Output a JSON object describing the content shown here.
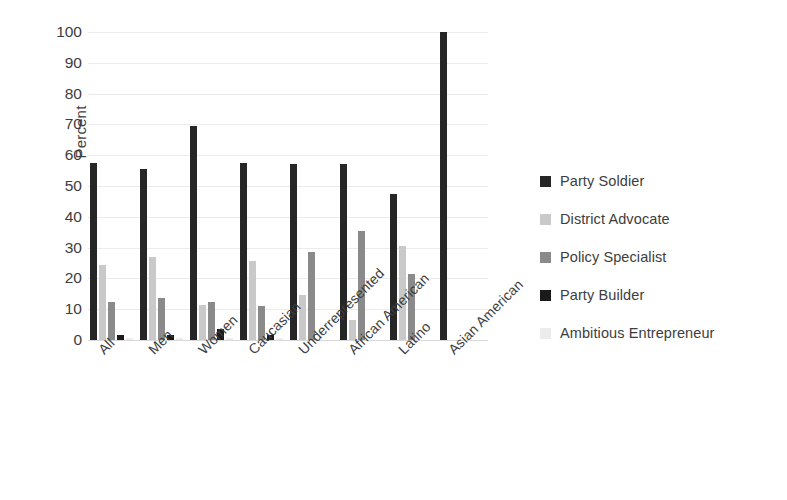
{
  "chart_data": {
    "type": "bar",
    "title": "",
    "subtitle": "",
    "xlabel": "",
    "ylabel": "Percent",
    "ylim": [
      0,
      100
    ],
    "yticks": [
      100,
      90,
      80,
      70,
      60,
      50,
      40,
      30,
      20,
      10,
      0
    ],
    "grid": true,
    "legend_position": "right",
    "categories": [
      "All",
      "Men",
      "Women",
      "Caucasian",
      "Underrepresented",
      "African American",
      "Latino",
      "Asian American"
    ],
    "series": [
      {
        "name": "Party Soldier",
        "color": "#262626",
        "values": [
          57.5,
          55.5,
          69.5,
          57.5,
          57.0,
          57.0,
          47.5,
          100.0
        ]
      },
      {
        "name": "District Advocate",
        "color": "#c9c9c9",
        "values": [
          24.5,
          27.0,
          11.5,
          25.5,
          14.5,
          6.5,
          30.5,
          0.0
        ]
      },
      {
        "name": "Policy Specialist",
        "color": "#8a8a8a",
        "values": [
          12.5,
          13.5,
          12.5,
          11.0,
          28.5,
          35.5,
          21.5,
          0.0
        ]
      },
      {
        "name": "Party Builder",
        "color": "#1a1a1a",
        "values": [
          1.5,
          1.5,
          3.5,
          1.5,
          0.0,
          0.0,
          0.0,
          0.0
        ]
      },
      {
        "name": "Ambitious Entrepreneur",
        "color": "#ececec",
        "values": [
          0.8,
          0.8,
          0.8,
          0.8,
          0.0,
          0.0,
          0.0,
          0.0
        ]
      }
    ]
  },
  "legend": {
    "items": [
      {
        "label": "Party Soldier",
        "color": "#262626"
      },
      {
        "label": "District Advocate",
        "color": "#c9c9c9"
      },
      {
        "label": "Policy Specialist",
        "color": "#8a8a8a"
      },
      {
        "label": "Party Builder",
        "color": "#1a1a1a"
      },
      {
        "label": "Ambitious Entrepreneur",
        "color": "#ececec"
      }
    ]
  }
}
